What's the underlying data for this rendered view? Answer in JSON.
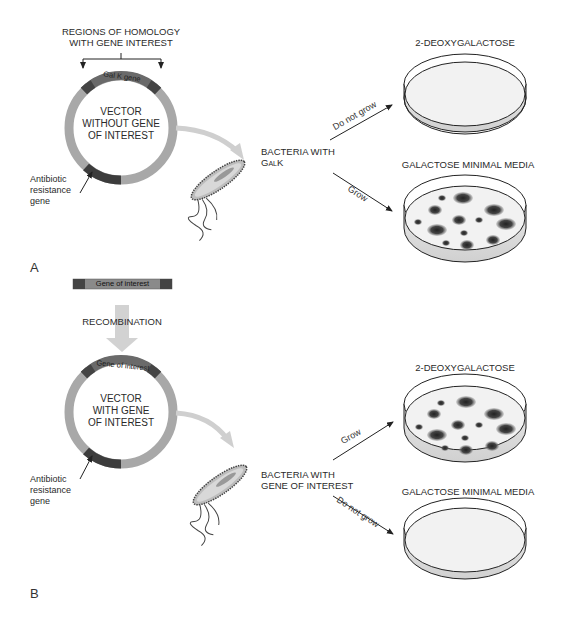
{
  "panel_a": {
    "label": "A",
    "homology_label_line1": "REGIONS OF HOMOLOGY",
    "homology_label_line2": "WITH GENE INTEREST",
    "ring_gene_label": "Gal K gene",
    "vector_line1": "VECTOR",
    "vector_line2": "WITHOUT GENE",
    "vector_line3": "OF INTEREST",
    "antibiotic_line1": "Antibiotic",
    "antibiotic_line2": "resistance",
    "antibiotic_line3": "gene",
    "bacteria_line1": "BACTERIA WITH",
    "bacteria_line2": "GalK",
    "arrow_top_label": "Do not grow",
    "arrow_bottom_label": "Grow",
    "plate_top_title": "2-DEOXYGALACTOSE",
    "plate_bottom_title": "GALACTOSE MINIMAL MEDIA"
  },
  "middle": {
    "insert_label": "Gene of interest",
    "recombination_label": "RECOMBINATION"
  },
  "panel_b": {
    "label": "B",
    "ring_gene_label": "Gene of interest",
    "vector_line1": "VECTOR",
    "vector_line2": "WITH GENE",
    "vector_line3": "OF INTEREST",
    "antibiotic_line1": "Antibiotic",
    "antibiotic_line2": "resistance",
    "antibiotic_line3": "gene",
    "bacteria_line1": "BACTERIA WITH",
    "bacteria_line2": "GENE OF INTEREST",
    "arrow_top_label": "Grow",
    "arrow_bottom_label": "Do not grow",
    "plate_top_title": "2-DEOXYGALACTOSE",
    "plate_bottom_title": "GALACTOSE MINIMAL MEDIA"
  },
  "colors": {
    "ring": "#9a9a9a",
    "ring_dark": "#555555",
    "plate_fill": "#f2f2f2",
    "colony": "#3a3a3a",
    "transfer_arrow": "#cfcfcf"
  }
}
